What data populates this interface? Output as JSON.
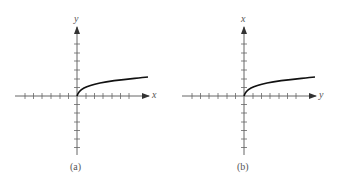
{
  "panels": [
    {
      "id": "a",
      "caption": "(a)",
      "horizontal_axis_label": "x",
      "vertical_axis_label": "y",
      "curve": "square-root shaped curve starting at origin, increasing to the right"
    },
    {
      "id": "b",
      "caption": "(b)",
      "horizontal_axis_label": "y",
      "vertical_axis_label": "x",
      "curve": "square-root shaped curve starting at origin, increasing to the right"
    }
  ],
  "colors": {
    "axis": "#555555",
    "curve": "#111111"
  }
}
